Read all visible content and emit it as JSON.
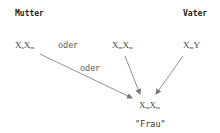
{
  "parents": {
    "mother": {
      "heading": "Mutter",
      "genotype_options": [
        {
          "base1": "X",
          "sub1": "a",
          "base2": "X",
          "sub2": "m"
        },
        {
          "base1": "X",
          "sub1": "m",
          "base2": "X",
          "sub2": "m"
        }
      ],
      "separator": "oder"
    },
    "father": {
      "heading": "Vater",
      "genotype": {
        "base1": "X",
        "sub1": "m",
        "base2": "Y"
      }
    }
  },
  "offspring": {
    "genotype": {
      "base1": "X",
      "sub1": "m",
      "base2": "X",
      "sub2": "m"
    },
    "label": "\"Frau\""
  },
  "arrow_label": "oder",
  "colors": {
    "text": "#333333",
    "arrow": "#777777",
    "background": "#ffffff"
  }
}
